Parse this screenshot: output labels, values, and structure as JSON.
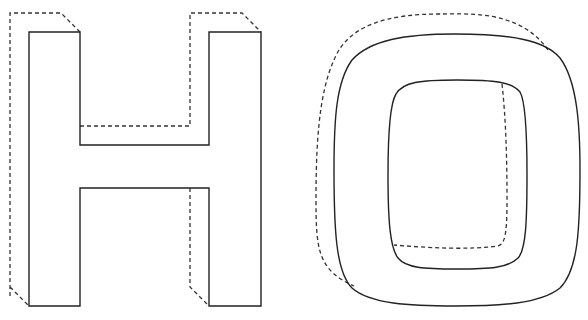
{
  "diagram": {
    "letters": [
      {
        "id": "H",
        "label": "H",
        "style": "block letter, solid front face, dashed hidden back edges"
      },
      {
        "id": "O",
        "label": "O",
        "style": "rounded block letter, solid front face, dashed hidden back edges"
      }
    ],
    "colors": {
      "stroke": "#222222",
      "dashed": "#333333",
      "background": "#ffffff"
    }
  }
}
